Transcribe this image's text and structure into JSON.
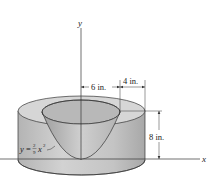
{
  "figure": {
    "axes": {
      "x_label": "x",
      "y_label": "y"
    },
    "dimensions": {
      "inner_radius": "6 in.",
      "wall_thickness": "4 in.",
      "height": "8 in."
    },
    "equation": {
      "lhs": "y",
      "eq": "=",
      "num": "2",
      "den": "9",
      "var": "x",
      "exp": "2"
    },
    "colors": {
      "solid_fill": "#c9c9c9",
      "solid_dark": "#a9a9a9",
      "top_face": "#d6d6d6",
      "bowl_inner": "#bdbdbd",
      "line": "#333333"
    }
  }
}
